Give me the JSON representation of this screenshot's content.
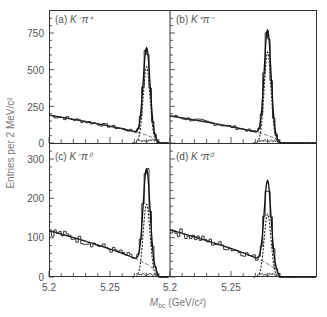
{
  "figure": {
    "ylabel": "Entries per 2 MeV/c²",
    "xlabel_main": "M",
    "xlabel_sub": "bc",
    "xlabel_unit": " (GeV/c²)"
  },
  "chart_data": [
    {
      "type": "line",
      "panel": "a",
      "title": "(a) K⁻π⁺",
      "label_prefix": "(a) ",
      "label_particles": "K⁻π⁺",
      "xlabel": "M_bc (GeV/c²)",
      "ylabel": "Entries per 2 MeV/c²",
      "xlim": [
        5.2,
        5.3
      ],
      "ylim": [
        0,
        900
      ],
      "yticks": [
        0,
        250,
        500,
        750
      ],
      "xticks": [
        5.2,
        5.25
      ],
      "background_level": 190,
      "peak_position": 5.28,
      "peak_height_total": 650,
      "peak_height_signal": 520,
      "series": [
        {
          "name": "data histogram",
          "style": "step"
        },
        {
          "name": "total fit",
          "style": "solid"
        },
        {
          "name": "signal",
          "style": "dashed-dotted"
        },
        {
          "name": "background (ARGUS)",
          "style": "dashed"
        }
      ]
    },
    {
      "type": "line",
      "panel": "b",
      "title": "(b) K⁺π⁻",
      "label_prefix": "(b) ",
      "label_particles": "K⁺π⁻",
      "xlim": [
        5.2,
        5.3
      ],
      "ylim": [
        0,
        900
      ],
      "yticks": [
        0,
        250,
        500,
        750
      ],
      "xticks": [
        5.2,
        5.25
      ],
      "background_level": 185,
      "peak_position": 5.28,
      "peak_height_total": 770,
      "peak_height_signal": 620
    },
    {
      "type": "line",
      "panel": "c",
      "title": "(c) K⁻π⁰",
      "label_prefix": "(c) ",
      "label_particles": "K⁻π⁰",
      "xlim": [
        5.2,
        5.3
      ],
      "ylim": [
        0,
        350
      ],
      "yticks": [
        0,
        100,
        200,
        300
      ],
      "xticks": [
        5.2,
        5.25
      ],
      "background_level": 118,
      "peak_position": 5.28,
      "peak_height_total": 275,
      "peak_height_signal": 185
    },
    {
      "type": "line",
      "panel": "d",
      "title": "(d) K⁺π⁰",
      "label_prefix": "(d) ",
      "label_particles": "K⁺π⁰",
      "xlim": [
        5.2,
        5.3
      ],
      "ylim": [
        0,
        350
      ],
      "yticks": [
        0,
        100,
        200,
        300
      ],
      "xticks": [
        5.2,
        5.25
      ],
      "background_level": 120,
      "peak_position": 5.28,
      "peak_height_total": 245,
      "peak_height_signal": 160
    }
  ],
  "ticks": {
    "top_y": [
      "750",
      "500",
      "250",
      "0"
    ],
    "bottom_y": [
      "300",
      "200",
      "100",
      "0"
    ],
    "x": [
      "5.2",
      "5.25",
      "5.2",
      "5.25"
    ]
  }
}
